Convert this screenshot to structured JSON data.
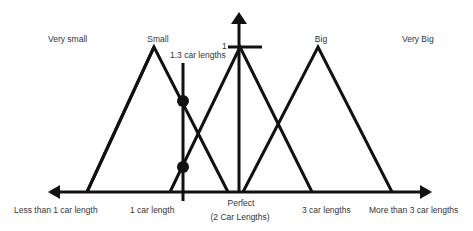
{
  "diagram": {
    "type": "fuzzy-membership-functions",
    "colors": {
      "line": "#111111",
      "text": "#333333",
      "background": "#ffffff"
    },
    "y_axis": {
      "max_label": "1"
    },
    "membership_sets": [
      {
        "name": "Very small",
        "label": "Very small"
      },
      {
        "name": "Small",
        "label": "Small"
      },
      {
        "name": "Perfect",
        "label": "Perfect"
      },
      {
        "name": "Big",
        "label": "Big"
      },
      {
        "name": "Very Big",
        "label": "Very Big"
      }
    ],
    "x_axis_labels": [
      "Less than 1 car length",
      "1 car length",
      "Perfect",
      "(2 Car Lengths)",
      "3 car lengths",
      "More than 3 car lengths"
    ],
    "input_marker": {
      "label": "1.3 car lengths",
      "intersections": 2
    }
  }
}
